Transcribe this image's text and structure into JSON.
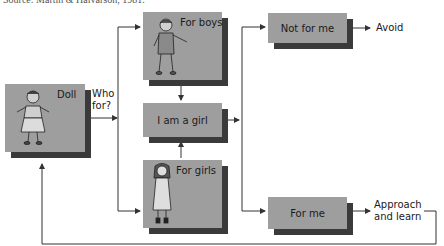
{
  "source": "Source: Martin & Halvarson, 1981.",
  "nodes": {
    "doll": {
      "label": "Doll"
    },
    "who_for": {
      "line1": "Who",
      "line2": "for?"
    },
    "for_boys": {
      "label": "For boys"
    },
    "i_am_a_girl": {
      "label": "I am a girl"
    },
    "for_girls": {
      "label": "For girls"
    },
    "not_for_me": {
      "label": "Not for me"
    },
    "for_me": {
      "label": "For me"
    },
    "avoid": {
      "label": "Avoid"
    },
    "approach": {
      "line1": "Approach",
      "line2": "and learn"
    }
  },
  "colors": {
    "box_fill": "#9e9e9e",
    "box_shadow": "#3a3a3a",
    "line": "#333333"
  },
  "edges": [
    {
      "from": "doll",
      "to": "for_boys"
    },
    {
      "from": "doll",
      "to": "for_girls"
    },
    {
      "from": "for_boys",
      "to": "i_am_a_girl"
    },
    {
      "from": "for_girls",
      "to": "i_am_a_girl"
    },
    {
      "from": "i_am_a_girl",
      "to": "not_for_me"
    },
    {
      "from": "i_am_a_girl",
      "to": "for_me"
    },
    {
      "from": "not_for_me",
      "to": "avoid"
    },
    {
      "from": "for_me",
      "to": "approach"
    },
    {
      "from": "approach",
      "to": "doll"
    }
  ]
}
